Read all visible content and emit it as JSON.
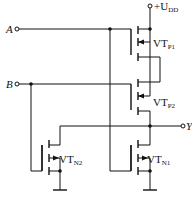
{
  "diagram": {
    "type": "CMOS logic gate schematic",
    "supply": {
      "prefix": "+U",
      "sub": "DD"
    },
    "inputs": [
      {
        "label": "A"
      },
      {
        "label": "B"
      }
    ],
    "output": {
      "label": "Y"
    },
    "transistors": [
      {
        "id": "VT_P1",
        "label": "VT",
        "sub": "P1",
        "type": "PMOS"
      },
      {
        "id": "VT_P2",
        "label": "VT",
        "sub": "P2",
        "type": "PMOS"
      },
      {
        "id": "VT_N1",
        "label": "VT",
        "sub": "N1",
        "type": "NMOS"
      },
      {
        "id": "VT_N2",
        "label": "VT",
        "sub": "N2",
        "type": "NMOS"
      }
    ]
  }
}
